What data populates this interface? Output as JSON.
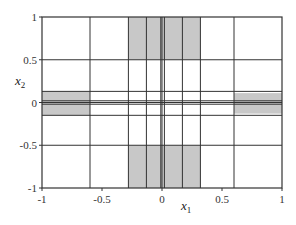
{
  "chart_data": {
    "type": "heatmap",
    "title": "",
    "xlabel": "x1",
    "ylabel": "x2",
    "xlim": [
      -1,
      1
    ],
    "ylim": [
      -1,
      1
    ],
    "x_ticks": [
      -1,
      -0.5,
      0,
      0.5,
      1
    ],
    "y_ticks": [
      -1,
      -0.5,
      0,
      0.5,
      1
    ],
    "x_tick_labels": [
      "-1",
      "-0.5",
      "0",
      "0.5",
      "1"
    ],
    "y_tick_labels": [
      "-1",
      "-0.5",
      "0",
      "0.5",
      "1"
    ],
    "grid": false,
    "vertical_lines_x": [
      -0.6,
      -0.28,
      -0.13,
      -0.01,
      0.0,
      0.02,
      0.17,
      0.32,
      0.6
    ],
    "horizontal_lines_y": [
      0.5,
      0.13,
      0.02,
      0.0,
      -0.02,
      -0.15,
      -0.5
    ],
    "shaded_regions": [
      {
        "x": [
          -0.28,
          0.32
        ],
        "y": [
          0.5,
          1.0
        ]
      },
      {
        "x": [
          -0.28,
          0.32
        ],
        "y": [
          -1.0,
          -0.5
        ]
      },
      {
        "x": [
          -1.0,
          -0.6
        ],
        "y": [
          -0.15,
          0.13
        ]
      },
      {
        "x": [
          0.6,
          1.0
        ],
        "y": [
          -0.13,
          0.11
        ]
      }
    ],
    "colors": {
      "shade": "#c8c8c8",
      "line": "#333333",
      "background": "#ffffff"
    }
  },
  "labels": {
    "x_main": "x",
    "x_sub": "1",
    "y_main": "x",
    "y_sub": "2"
  }
}
